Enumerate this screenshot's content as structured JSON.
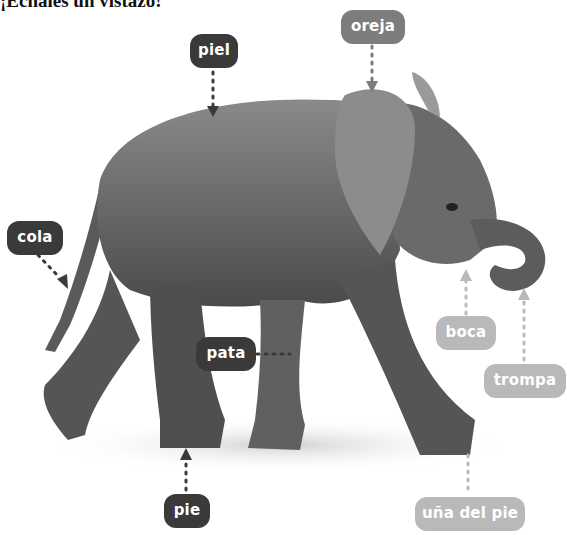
{
  "title": "¡Échales un vistazo!",
  "image": {
    "subject": "elephant-calf",
    "description": "Baby elephant walking, photographed in grayscale"
  },
  "labels": {
    "piel": "piel",
    "oreja": "oreja",
    "cola": "cola",
    "pata": "pata",
    "pie": "pie",
    "boca": "boca",
    "trompa": "trompa",
    "una": "uña del pie"
  },
  "colors": {
    "dark_label": "#3a3a3a",
    "mid_label": "#7d7d7d",
    "light_label": "#b9b9b9"
  }
}
